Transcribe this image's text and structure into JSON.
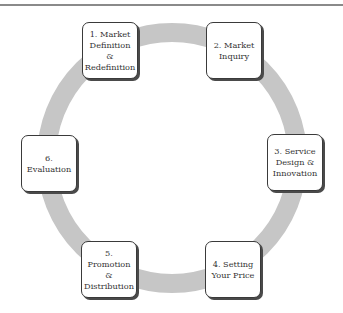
{
  "diagram": {
    "type": "cycle",
    "ring_color": "#c6c6c6",
    "steps": [
      {
        "id": 1,
        "label": "1. Market\nDefinition\n&\nRedefinition"
      },
      {
        "id": 2,
        "label": "2. Market\nInquiry"
      },
      {
        "id": 3,
        "label": "3. Service\nDesign &\nInnovation"
      },
      {
        "id": 4,
        "label": "4. Setting\nYour Price"
      },
      {
        "id": 5,
        "label": "5. Promotion\n&\nDistribution"
      },
      {
        "id": 6,
        "label": "6. Evaluation"
      }
    ]
  }
}
